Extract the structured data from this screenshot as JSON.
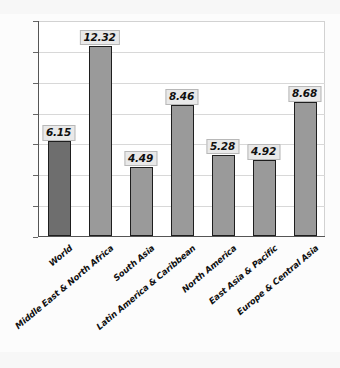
{
  "chart_data": {
    "type": "bar",
    "title": "",
    "xlabel": "",
    "ylabel": "",
    "ylim": [
      0,
      14
    ],
    "grid": true,
    "legend": "none",
    "unit": "%",
    "categories": [
      "World",
      "Middle East & North Africa",
      "South Asia",
      "Latin America & Caribbean",
      "North America",
      "East Asia & Pacific",
      "Europe & Central Asia"
    ],
    "values": [
      6.15,
      12.32,
      4.49,
      8.46,
      5.28,
      4.92,
      8.68
    ],
    "value_labels": [
      "6.15",
      "12.32",
      "4.49",
      "8.46",
      "5.28",
      "4.92",
      "8.68"
    ],
    "yticks": [
      0,
      2,
      4,
      6,
      8,
      10,
      12,
      14
    ],
    "ytick_labels": [
      "0",
      "2",
      "4",
      "6",
      "8",
      "10",
      "12",
      "14%"
    ],
    "highlight_index": 0,
    "colors": {
      "bar_default": "#9a9a9a",
      "bar_highlight": "#6e6e6e",
      "bar_border": "#1e1e1e",
      "gridline": "#d8d8d8",
      "axis": "#555555",
      "label_background": "#e9e9e9",
      "label_border": "#b8b8b8",
      "text": "#101010",
      "plot_background": "#ffffff",
      "page_background": "#fcfcfc"
    }
  }
}
